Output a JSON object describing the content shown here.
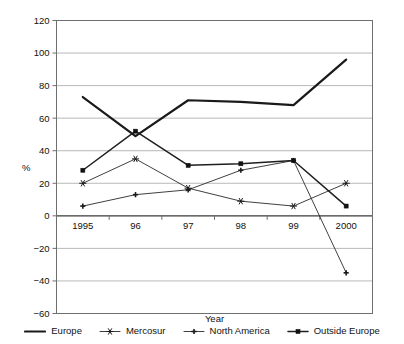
{
  "chart_data": {
    "type": "line",
    "title": "",
    "xlabel": "Year",
    "ylabel": "%",
    "categories": [
      "1995",
      "96",
      "97",
      "98",
      "99",
      "2000"
    ],
    "ylim": [
      -60,
      120
    ],
    "yticks": [
      -60,
      -40,
      -20,
      0,
      20,
      40,
      60,
      80,
      100,
      120
    ],
    "ytick_labels": [
      "−60",
      "−40",
      "−20",
      "0",
      "20",
      "40",
      "60",
      "80",
      "100",
      "120"
    ],
    "grid": true,
    "legend_position": "bottom",
    "series": [
      {
        "name": "Europe",
        "marker": "none",
        "values": [
          73,
          49,
          71,
          70,
          68,
          96
        ]
      },
      {
        "name": "Mercosur",
        "marker": "star",
        "values": [
          20,
          35,
          17,
          9,
          6,
          20
        ]
      },
      {
        "name": "North America",
        "marker": "plus",
        "values": [
          6,
          13,
          16,
          28,
          34,
          -35
        ]
      },
      {
        "name": "Outside Europe",
        "marker": "square",
        "values": [
          28,
          52,
          31,
          32,
          34,
          6
        ]
      }
    ]
  },
  "axis": {
    "y_title": "%",
    "x_title": "Year"
  },
  "legend": {
    "items": [
      {
        "label": "Europe",
        "icon": "line-swatch-icon"
      },
      {
        "label": "Mercosur",
        "icon": "star-marker-icon"
      },
      {
        "label": "North America",
        "icon": "plus-marker-icon"
      },
      {
        "label": "Outside Europe",
        "icon": "square-marker-icon"
      }
    ]
  },
  "colors": {
    "line": "#1a1a1a",
    "grid": "#9a9a9a",
    "frame": "#6f6f6f",
    "background": "#ffffff"
  }
}
